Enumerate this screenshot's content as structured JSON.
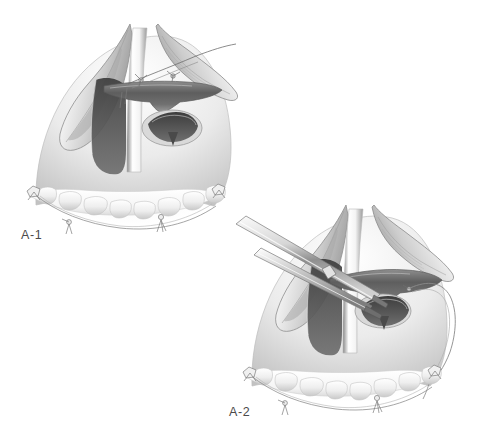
{
  "figure": {
    "type": "medical-surgical-illustration",
    "background_color": "#ffffff",
    "ink_color": "#4a4a4a",
    "panels": [
      {
        "id": "A-1",
        "label": "A-1",
        "label_x": 21,
        "label_y": 228,
        "caption_text": "A-1",
        "description": "Retracted palatal mucoperiosteal flaps with nasal-layer sutures placed across the cleft; mouth gag retracting, teeth arch with stay sutures below.",
        "elements": [
          "left-mucoperiosteal-flap",
          "right-mucoperiosteal-flap",
          "cleft-margin",
          "nasal-mucosa-suture-line",
          "soft-palate-muscle-band",
          "oropharyngeal-opening",
          "uvula-column-highlight",
          "maxillary-teeth-arch",
          "stay-suture-left",
          "stay-suture-right",
          "stay-suture-anterior",
          "suture-thread-tail"
        ]
      },
      {
        "id": "A-2",
        "label": "A-2",
        "label_x": 229,
        "label_y": 405,
        "caption_text": "A-2",
        "description": "Needle holder and forceps grasping the suture at the nasal layer; continuation of the closure with a looped suture thread running to the right.",
        "elements": [
          "needle-holder-instrument",
          "tissue-forceps-instrument",
          "left-mucoperiosteal-flap",
          "right-mucoperiosteal-flap",
          "soft-palate-muscle-band",
          "oropharyngeal-opening",
          "suture-loop-right",
          "maxillary-teeth-arch",
          "stay-suture-left",
          "stay-suture-right",
          "stay-suture-anterior"
        ]
      }
    ]
  }
}
